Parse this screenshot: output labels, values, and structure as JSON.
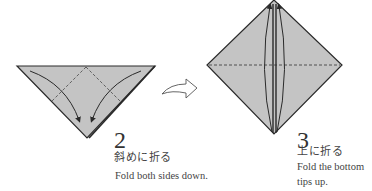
{
  "steps": [
    {
      "number": "2",
      "instruction_jp": "斜めに折る",
      "instruction_en": "Fold both sides down.",
      "shape": "triangle",
      "fold_lines": "dashed diagonals from top center",
      "arrows": "two curved arrows pointing down to bottom tip"
    },
    {
      "number": "3",
      "instruction_jp": "上に折る",
      "instruction_en": "Fold the bottom tips up.",
      "shape": "diamond",
      "fold_lines": "dashed horizontal center line",
      "arrows": "two curved arrows pointing up to top tip"
    }
  ],
  "transition_arrow": "hollow-right-arrow",
  "colors": {
    "paper_fill": "#c4c4c4",
    "outline": "#2a2a2a",
    "background": "#ffffff"
  }
}
